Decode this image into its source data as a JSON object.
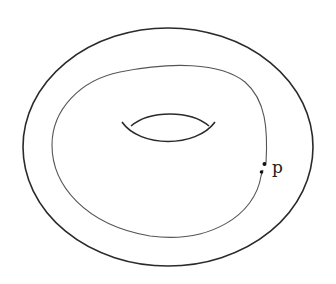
{
  "diagram": {
    "point_label": "p",
    "stroke_color": "#2a2a2a",
    "curve_color": "#555555",
    "background": "#ffffff"
  }
}
